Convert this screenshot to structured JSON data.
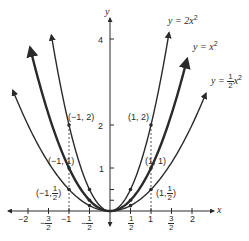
{
  "chart_data": {
    "type": "line",
    "title": "",
    "xlabel": "x",
    "ylabel": "y",
    "xlim": [
      -2.6,
      3.2
    ],
    "ylim": [
      -0.6,
      4.9
    ],
    "grid": false,
    "legend_position": "inline labels near curve ends",
    "x_ticks": [
      {
        "value": -2,
        "label": "-2"
      },
      {
        "value": -1.5,
        "label_num": "3",
        "label_den": "2",
        "sign": "-"
      },
      {
        "value": -1,
        "label": "-1"
      },
      {
        "value": -0.5,
        "label_num": "1",
        "label_den": "2",
        "sign": "-"
      },
      {
        "value": 0.5,
        "label_num": "1",
        "label_den": "2",
        "sign": ""
      },
      {
        "value": 1,
        "label": "1"
      },
      {
        "value": 1.5,
        "label_num": "3",
        "label_den": "2",
        "sign": ""
      },
      {
        "value": 2,
        "label": "2"
      }
    ],
    "y_ticks": [
      {
        "value": 0.25,
        "label": ""
      },
      {
        "value": 0.5,
        "label": ""
      },
      {
        "value": 1,
        "label": "1"
      },
      {
        "value": 2,
        "label": "2"
      },
      {
        "value": 4,
        "label": "4"
      }
    ],
    "series": [
      {
        "name": "y = 2x^2",
        "label_prefix": "y = 2",
        "coef": 2,
        "x_range": [
          -1.43,
          1.44
        ],
        "stroke_width": 1.4,
        "points": [
          [
            -1,
            2
          ],
          [
            -0.5,
            0.5
          ],
          [
            0.5,
            0.5
          ],
          [
            1,
            2
          ]
        ]
      },
      {
        "name": "y = x^2",
        "label_prefix": "y = ",
        "coef": 1,
        "x_range": [
          -1.95,
          1.88
        ],
        "stroke_width": 2.4,
        "points": [
          [
            -1,
            1
          ],
          [
            -0.5,
            0.25
          ],
          [
            0.5,
            0.25
          ],
          [
            1,
            1
          ]
        ]
      },
      {
        "name": "y = 1/2 x^2",
        "label_prefix": "y = ",
        "coef": 0.5,
        "x_range": [
          -2.37,
          2.34
        ],
        "stroke_width": 1.4,
        "points": [
          [
            -1,
            0.5
          ],
          [
            -0.5,
            0.125
          ],
          [
            0.5,
            0.125
          ],
          [
            1,
            0.5
          ]
        ]
      }
    ],
    "annotations": [
      {
        "text": "(-1, 2)",
        "x": -1,
        "y": 2
      },
      {
        "text": "(1, 2)",
        "x": 1,
        "y": 2
      },
      {
        "text": "(-1, 1)",
        "x": -1,
        "y": 1
      },
      {
        "text": "(1, 1)",
        "x": 1,
        "y": 1
      },
      {
        "text": "(-1, 1/2)",
        "x": -1,
        "y": 0.5
      },
      {
        "text": "(1, 1/2)",
        "x": 1,
        "y": 0.5
      }
    ],
    "dashed_guides": [
      {
        "x": -1,
        "y_to": 2
      },
      {
        "x": 1,
        "y_to": 2
      }
    ]
  },
  "labels": {
    "x_axis": "x",
    "y_axis": "y",
    "curve_2x2": {
      "prefix": "y = 2",
      "var": "x",
      "exp": "2"
    },
    "curve_x2": {
      "prefix": "y = ",
      "var": "x",
      "exp": "2"
    },
    "curve_half_x2": {
      "prefix": "y = ",
      "num": "1",
      "den": "2",
      "var": "x",
      "exp": "2"
    },
    "pt_m1_2": "(−1, 2)",
    "pt_1_2": "(1, 2)",
    "pt_m1_1": "(−1, 1)",
    "pt_1_1": "(1, 1)",
    "pt_m1_half_prefix": "(−1,",
    "pt_1_half_prefix": "(1,",
    "half_num": "1",
    "half_den": "2",
    "close_paren": ")",
    "ytick_4": "4",
    "ytick_2": "2",
    "ytick_1": "1",
    "xtick_m2": "−2",
    "xtick_m1": "−1",
    "xtick_1": "1",
    "xtick_2": "2",
    "minus": "−",
    "three": "3",
    "one": "1",
    "two": "2"
  },
  "colors": {
    "ink": "#2a2a2a",
    "background": "#ffffff"
  }
}
